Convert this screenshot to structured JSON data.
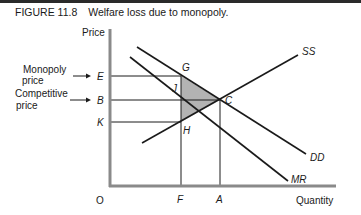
{
  "figure": {
    "number": "FIGURE 11.8",
    "title": "Welfare loss due to monopoly."
  },
  "axes": {
    "y_label": "Price",
    "x_label": "Quantity",
    "origin_label": "O"
  },
  "price_levels": [
    {
      "id": "E",
      "label": "E",
      "annotation": "Monopoly price"
    },
    {
      "id": "B",
      "label": "B",
      "annotation": "Competitive price"
    },
    {
      "id": "K",
      "label": "K",
      "annotation": ""
    }
  ],
  "annotations": {
    "monopoly_line1": "Monopoly",
    "monopoly_line2": "price",
    "competitive_line1": "Competitive",
    "competitive_line2": "price"
  },
  "quantity_levels": [
    {
      "id": "F",
      "label": "F"
    },
    {
      "id": "A",
      "label": "A"
    }
  ],
  "points": {
    "G": "G",
    "J": "J",
    "C": "C",
    "H": "H"
  },
  "curves": {
    "supply": "SS",
    "demand": "DD",
    "marginal_revenue": "MR"
  },
  "shaded_region": {
    "description": "Welfare loss triangle GCH",
    "color": "#b3b3b3"
  },
  "colors": {
    "line": "#1a1a1a",
    "axis": "#8a8a8a",
    "shade": "#b3b3b3"
  }
}
